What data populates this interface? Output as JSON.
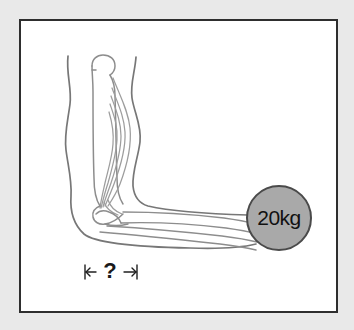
{
  "figure": {
    "name": "arm-biomechanics-diagram",
    "background_color": "#e9e9e9",
    "panel_background": "#ffffff",
    "panel_border_color": "#2e2e2e",
    "line_color": "#6e6e6e",
    "bone_line_color": "#8a8a8a",
    "muscle_line_color": "#9a9a9a",
    "weight": {
      "label": "20kg",
      "fill_color": "#a9a9a9",
      "stroke_color": "#4a4a4a",
      "center_x": 279,
      "center_y": 218,
      "radius": 32
    },
    "dimension": {
      "label": "?",
      "left_arrow": "left-arrow",
      "right_arrow": "right-arrow",
      "tick_left": "dimension-tick-left",
      "tick_right": "dimension-tick-right",
      "start_x": 85,
      "end_x": 138,
      "y": 272
    },
    "anatomy": {
      "humerus": "humerus-bone",
      "biceps": "biceps-muscle",
      "elbow": "elbow-joint",
      "forearm": "forearm-bones",
      "skin_outline": "arm-skin-outline",
      "humeral_head": "humeral-head"
    }
  }
}
